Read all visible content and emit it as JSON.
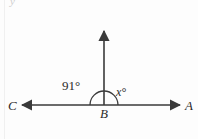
{
  "figure": {
    "kind": "geometry-angle-diagram",
    "background_color": "#fdfdfd",
    "stroke_color": "#3a3a3a",
    "text_color": "#2b2b2b",
    "canvas": {
      "width": 198,
      "height": 139
    },
    "points": {
      "vertex": {
        "name": "B",
        "x": 104,
        "y": 105
      },
      "left_end": {
        "name": "C",
        "x": 22,
        "y": 105
      },
      "right_end": {
        "name": "A",
        "x": 180,
        "y": 105
      },
      "ray_tip": {
        "x": 104,
        "y": 30
      }
    },
    "arc": {
      "center_x": 104,
      "center_y": 105,
      "radius": 14,
      "start_deg": 180,
      "end_deg": 0
    },
    "labels": {
      "point_c": "C",
      "point_b": "B",
      "point_a": "A",
      "angle_left": "91°",
      "angle_right": "x°"
    },
    "artifact": {
      "crop_glyph": "y"
    }
  }
}
